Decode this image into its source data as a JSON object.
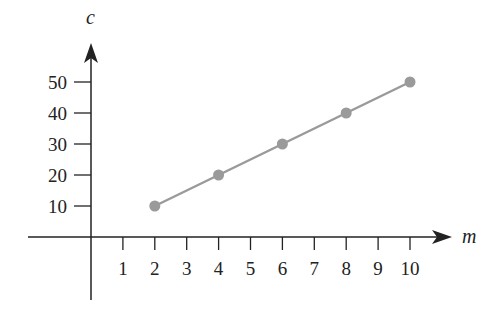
{
  "chart_data": {
    "type": "line",
    "title": "",
    "xlabel": "m",
    "ylabel": "c",
    "x": [
      2,
      4,
      6,
      8,
      10
    ],
    "series": [
      {
        "name": "c",
        "values": [
          10,
          20,
          30,
          40,
          50
        ],
        "color": "#9a9a9a",
        "markers": true
      }
    ],
    "x_ticks": [
      1,
      2,
      3,
      4,
      5,
      6,
      7,
      8,
      9,
      10
    ],
    "y_ticks": [
      10,
      20,
      30,
      40,
      50
    ],
    "xlim": [
      -2,
      11
    ],
    "ylim": [
      -20,
      60
    ],
    "grid": false,
    "legend": "none"
  },
  "colors": {
    "axis": "#222222",
    "line": "#9a9a9a",
    "marker": "#9a9a9a"
  }
}
